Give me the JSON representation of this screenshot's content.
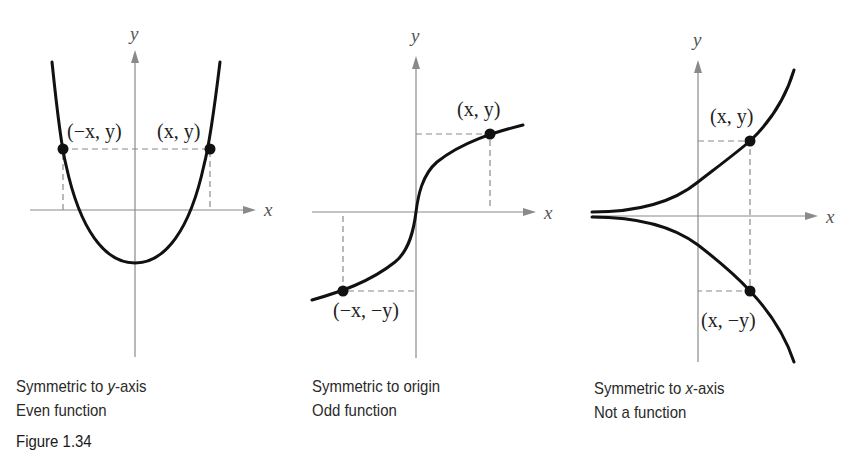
{
  "figure_label": "Figure 1.34",
  "panels": [
    {
      "id": "even",
      "axis_labels": {
        "x": "x",
        "y": "y"
      },
      "points": [
        {
          "label": "(−x, y)",
          "x": 63,
          "y": 149
        },
        {
          "label": "(x, y)",
          "x": 210,
          "y": 149
        }
      ],
      "caption": {
        "line1_prefix": "Symmetric to ",
        "line1_italic": "y",
        "line1_suffix": "-axis",
        "line2": "Even function"
      }
    },
    {
      "id": "odd",
      "axis_labels": {
        "x": "x",
        "y": "y"
      },
      "points": [
        {
          "label": "(x, y)",
          "x": 490,
          "y": 135
        },
        {
          "label": "(−x, −y)",
          "x": 343,
          "y": 291
        }
      ],
      "caption": {
        "line1": "Symmetric to origin",
        "line2": "Odd function"
      }
    },
    {
      "id": "x-axis",
      "axis_labels": {
        "x": "x",
        "y": "y"
      },
      "points": [
        {
          "label": "(x, y)",
          "x": 750,
          "y": 141
        },
        {
          "label": "(x, −y)",
          "x": 750,
          "y": 291
        }
      ],
      "caption": {
        "line1_prefix": "Symmetric to ",
        "line1_italic": "x",
        "line1_suffix": "-axis",
        "line2": "Not a function"
      }
    }
  ],
  "colors": {
    "curve": "#111111",
    "axis": "#8a8a8a",
    "text": "#2a2a2a"
  }
}
